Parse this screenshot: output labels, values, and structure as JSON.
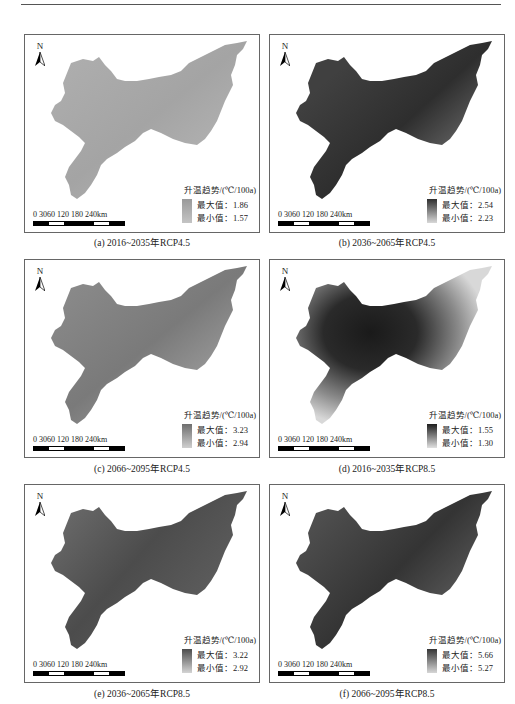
{
  "legend_title": "升温趋势/(℃/100a)",
  "legend_max_label": "最大值：",
  "legend_min_label": "最小值：",
  "north_label": "N",
  "scale_bar": {
    "labels": "0 3060   120  180  240km"
  },
  "panels": [
    {
      "id": "a",
      "caption": "(a)  2016~2035年RCP4.5",
      "max": "1.86",
      "min": "1.57",
      "dark": "#9a9a9a",
      "light": "#c4c4c4"
    },
    {
      "id": "b",
      "caption": "(b)  2036~2065年RCP4.5",
      "max": "2.54",
      "min": "2.23",
      "dark": "#2e2e2e",
      "light": "#d8d8d8"
    },
    {
      "id": "c",
      "caption": "(c)  2066~2095年RCP4.5",
      "max": "3.23",
      "min": "2.94",
      "dark": "#6e6e6e",
      "light": "#cfcfcf"
    },
    {
      "id": "d",
      "caption": "(d)  2016~2035年RCP8.5",
      "max": "1.55",
      "min": "1.30",
      "dark": "#1e1e1e",
      "light": "#e0e0e0"
    },
    {
      "id": "e",
      "caption": "(e)  2036~2065年RCP8.5",
      "max": "3.22",
      "min": "2.92",
      "dark": "#4c4c4c",
      "light": "#d4d4d4"
    },
    {
      "id": "f",
      "caption": "(f)  2066~2095年RCP8.5",
      "max": "5.66",
      "min": "5.27",
      "dark": "#353535",
      "light": "#d6d6d6"
    }
  ]
}
